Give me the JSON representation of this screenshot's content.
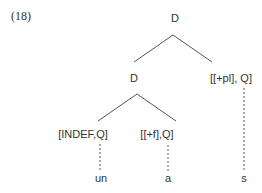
{
  "example_number": "(18)",
  "tree": {
    "root": "D",
    "left_child": "D",
    "right_child": "[[+pl], Q]",
    "left_left": "[INDEF,Q]",
    "left_right": "[[+f],Q]",
    "leaves": [
      "un",
      "a",
      "s"
    ]
  }
}
